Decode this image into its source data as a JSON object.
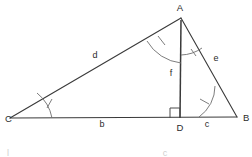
{
  "figure": {
    "type": "geometry-diagram",
    "shape": "triangle-with-altitude",
    "background_color": "#ffffff",
    "line_color": "#3a3a3a",
    "arc_color": "#6e6e6e",
    "text_color": "#2b2b2b"
  },
  "vertices": [
    {
      "id": "A",
      "label": "A",
      "x": 181,
      "y": 18,
      "label_x": 180,
      "label_y": 11
    },
    {
      "id": "B",
      "label": "B",
      "x": 237,
      "y": 117,
      "label_x": 243,
      "label_y": 121
    },
    {
      "id": "C",
      "label": "C",
      "x": 10,
      "y": 118,
      "label_x": 5,
      "label_y": 122
    },
    {
      "id": "D",
      "label": "D",
      "x": 180,
      "y": 118,
      "label_x": 180,
      "label_y": 131
    }
  ],
  "segments": [
    {
      "id": "d",
      "label": "d",
      "from": "C",
      "to": "A",
      "label_x": 95,
      "label_y": 58
    },
    {
      "id": "e",
      "label": "e",
      "from": "A",
      "to": "B",
      "label_x": 216,
      "label_y": 61
    },
    {
      "id": "b",
      "label": "b",
      "from": "C",
      "to": "D",
      "label_x": 102,
      "label_y": 127
    },
    {
      "id": "c",
      "label": "c",
      "from": "D",
      "to": "B",
      "label_x": 207,
      "label_y": 127
    },
    {
      "id": "f",
      "label": "f",
      "from": "A",
      "to": "D",
      "label_x": 171,
      "label_y": 76
    }
  ],
  "angle_marks": [
    {
      "id": "angle-C",
      "at": "C",
      "ticks": 1,
      "style": "single-arc-with-tick"
    },
    {
      "id": "angle-B",
      "at": "B",
      "ticks": 1,
      "style": "single-arc-with-tick"
    },
    {
      "id": "angle-CAD",
      "at": "A",
      "ticks": 1,
      "style": "single-arc-with-tick"
    },
    {
      "id": "angle-DAB",
      "at": "A",
      "ticks": 1,
      "style": "single-arc-with-tick"
    }
  ],
  "right_angle": {
    "id": "right-angle-D",
    "at": "D",
    "style": "square",
    "size": 10
  },
  "ghost_text": {
    "left": "l",
    "right": "c"
  }
}
